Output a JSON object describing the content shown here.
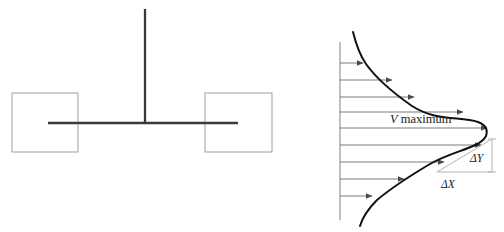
{
  "figure": {
    "width": 504,
    "height": 232,
    "background_color": "#ffffff"
  },
  "left_diagram": {
    "name": "plate-and-shaft-schematic",
    "stroke_color_dark": "#3a3a3a",
    "stroke_color_light": "#a8a8a8",
    "vertical_post": {
      "x": 145,
      "y_top": 9,
      "y_bottom": 123,
      "thickness": 2.2
    },
    "horizontal_bar": {
      "x_left": 48,
      "x_right": 238,
      "y": 123,
      "thickness": 2.2
    },
    "left_plate": {
      "x": 12,
      "y": 93,
      "width": 66,
      "height": 59
    },
    "right_plate": {
      "x": 205,
      "y": 93,
      "width": 67,
      "height": 59
    }
  },
  "velocity_profile": {
    "name": "velocity-profile-plot",
    "axis": {
      "x": 340,
      "y_top": 42,
      "y_bottom": 220,
      "color": "#8a8a8a"
    },
    "curve_color": "#111111",
    "arrow_color": "#6e6e6e",
    "triangle_color": "#b5b5b5",
    "apex_x": 487,
    "apex_y": 122,
    "arrow_rows_y": [
      63,
      80,
      97,
      114,
      131,
      148,
      165,
      182,
      199
    ],
    "arrow_tip_x": [
      363,
      392,
      414,
      430,
      479,
      489,
      478,
      430,
      409
    ],
    "labels": {
      "v_maximum_symbol": "V",
      "v_maximum_text": " maximum",
      "delta_y": "ΔY",
      "delta_x": "ΔX"
    }
  }
}
